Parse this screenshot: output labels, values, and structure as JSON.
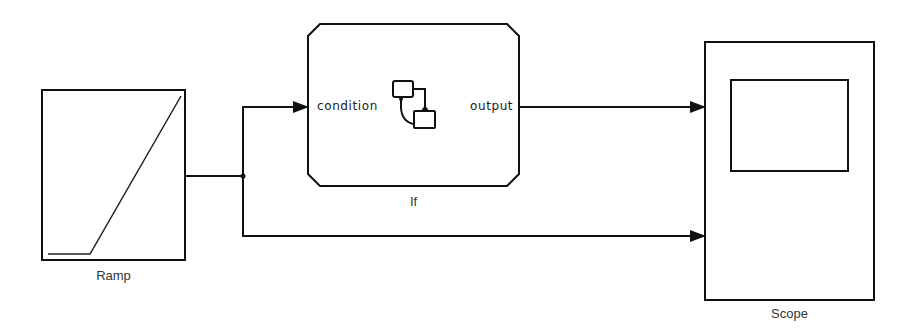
{
  "diagram": {
    "type": "simulink-model",
    "blocks": [
      {
        "id": "ramp",
        "label": "Ramp",
        "kind": "source"
      },
      {
        "id": "if",
        "label": "If",
        "kind": "subsystem",
        "ports": {
          "input": "condition",
          "output": "output"
        },
        "icon": "stateflow-chart-icon"
      },
      {
        "id": "scope",
        "label": "Scope",
        "kind": "sink",
        "inputs": 2
      }
    ],
    "connections": [
      {
        "from": "ramp",
        "to": "if.condition"
      },
      {
        "from": "if.output",
        "to": "scope.in1"
      },
      {
        "from": "ramp",
        "to": "scope.in2",
        "via": "branch-point"
      }
    ]
  },
  "labels": {
    "ramp": "Ramp",
    "if": "If",
    "scope": "Scope",
    "if_input_port": "condition",
    "if_output_port": "output"
  },
  "colors": {
    "line": "#111111",
    "block_fill": "#ffffff",
    "text": "#333333"
  }
}
